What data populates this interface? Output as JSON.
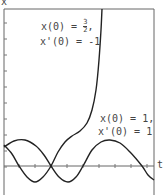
{
  "chart_data": {
    "type": "line",
    "title": "",
    "xlabel": "t",
    "ylabel": "x",
    "grid": false,
    "axis_ticks": {
      "x_tick_count": 9,
      "y_tick_count": 10
    },
    "series": [
      {
        "name": "x(0) = 3/2, x'(0) = -1",
        "annotation": {
          "line1_prefix": "x(0) = ",
          "num": "3",
          "den": "2",
          "line1_suffix": ",",
          "line2": "x'(0) = -1"
        },
        "behavior": "oscillates then blows up",
        "points_px": [
          [
            4,
            145
          ],
          [
            12,
            154
          ],
          [
            19,
            166
          ],
          [
            27,
            177
          ],
          [
            35,
            182
          ],
          [
            43,
            177
          ],
          [
            51,
            166
          ],
          [
            58,
            152
          ],
          [
            65,
            142
          ],
          [
            72,
            136
          ],
          [
            80,
            131
          ],
          [
            87,
            123
          ],
          [
            92,
            110
          ],
          [
            96,
            90
          ],
          [
            99,
            60
          ],
          [
            101,
            30
          ],
          [
            102,
            9
          ]
        ]
      },
      {
        "name": "x(0) = 1, x'(0) = 1",
        "annotation": {
          "line1": "x(0) = 1,",
          "line2": "x'(0) = 1"
        },
        "behavior": "periodic oscillation",
        "points_px": [
          [
            4,
            147
          ],
          [
            14,
            141
          ],
          [
            25,
            140
          ],
          [
            36,
            146
          ],
          [
            44,
            155
          ],
          [
            51,
            166
          ],
          [
            59,
            177
          ],
          [
            68,
            182
          ],
          [
            76,
            177
          ],
          [
            83,
            166
          ],
          [
            92,
            150
          ],
          [
            101,
            142
          ],
          [
            110,
            140
          ],
          [
            120,
            143
          ],
          [
            130,
            152
          ],
          [
            142,
            166
          ],
          [
            148,
            175
          ],
          [
            154,
            180
          ]
        ]
      }
    ]
  },
  "labels": {
    "y_axis": "x",
    "x_axis": "t"
  }
}
